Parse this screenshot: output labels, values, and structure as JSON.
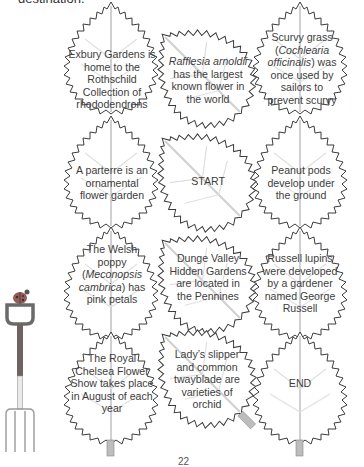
{
  "intro_text": "destination.",
  "colors": {
    "leaf_outline": "#3c3c3c",
    "leaf_fill": "#ffffff",
    "vein": "#d4d4d4",
    "stem": "#bdbdbd",
    "fork_handle": "#8a8a8a",
    "fork_shaft_top": "#7a6a6a",
    "ladybird": "#9a5a55"
  },
  "leaves": [
    {
      "id": "r1c1",
      "row": 1,
      "col": 1,
      "parts": [
        {
          "t": "Exbury Gardens is home to the Rothschild Collection of rhododendrons"
        }
      ]
    },
    {
      "id": "r1c2",
      "row": 1,
      "col": 2,
      "parts": [
        {
          "t": "Rafflesia arnoldii",
          "italic": true
        },
        {
          "t": " has the largest known flower in the world"
        }
      ]
    },
    {
      "id": "r1c3",
      "row": 1,
      "col": 3,
      "parts": [
        {
          "t": "Scurvy grass ("
        },
        {
          "t": "Cochlearia officinalis",
          "italic": true
        },
        {
          "t": ") was once used by sailors to prevent scurvy"
        }
      ]
    },
    {
      "id": "r2c1",
      "row": 2,
      "col": 1,
      "parts": [
        {
          "t": "A parterre is an ornamental flower garden"
        }
      ]
    },
    {
      "id": "r2c2",
      "row": 2,
      "col": 2,
      "parts": [
        {
          "t": "START"
        }
      ]
    },
    {
      "id": "r2c3",
      "row": 2,
      "col": 3,
      "parts": [
        {
          "t": "Peanut pods develop under the ground"
        }
      ]
    },
    {
      "id": "r3c1",
      "row": 3,
      "col": 1,
      "parts": [
        {
          "t": "The Welsh poppy ("
        },
        {
          "t": "Meconopsis cambrica",
          "italic": true
        },
        {
          "t": ") has pink petals"
        }
      ]
    },
    {
      "id": "r3c2",
      "row": 3,
      "col": 2,
      "parts": [
        {
          "t": "Dunge Valley Hidden Gardens are located in the Pennines"
        }
      ]
    },
    {
      "id": "r3c3",
      "row": 3,
      "col": 3,
      "parts": [
        {
          "t": "Russell lupins were developed by a gardener named George Russell"
        }
      ]
    },
    {
      "id": "r4c1",
      "row": 4,
      "col": 1,
      "parts": [
        {
          "t": "The Royal Chelsea Flower Show takes place in August of each year"
        }
      ]
    },
    {
      "id": "r4c2",
      "row": 4,
      "col": 2,
      "parts": [
        {
          "t": "Lady’s slipper and common twayblade are varieties of orchid"
        }
      ]
    },
    {
      "id": "r4c3",
      "row": 4,
      "col": 3,
      "parts": [
        {
          "t": "END"
        }
      ]
    }
  ],
  "decorations": [
    {
      "name": "ladybird-icon"
    },
    {
      "name": "garden-fork-icon"
    }
  ],
  "page_number": "22"
}
